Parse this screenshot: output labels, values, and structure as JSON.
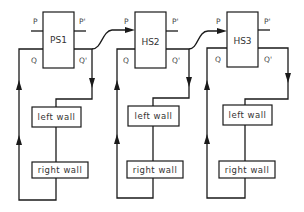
{
  "diagram": {
    "stages": [
      {
        "name": "PS1",
        "pins": {
          "p": "P",
          "p_prime": "P'",
          "q": "Q",
          "q_prime": "Q'"
        },
        "left_wall": "left wall",
        "right_wall": "right wall"
      },
      {
        "name": "HS2",
        "pins": {
          "p": "P",
          "p_prime": "P'",
          "q": "Q",
          "q_prime": "Q'"
        },
        "left_wall": "left wall",
        "right_wall": "right wall"
      },
      {
        "name": "HS3",
        "pins": {
          "p": "P",
          "p_prime": "P'",
          "q": "Q",
          "q_prime": "Q'"
        },
        "left_wall": "left wall",
        "right_wall": "right wall"
      }
    ],
    "connections": [
      {
        "from": "PS1.Q'",
        "to": "HS2.P"
      },
      {
        "from": "HS2.Q'",
        "to": "HS3.P"
      }
    ]
  }
}
